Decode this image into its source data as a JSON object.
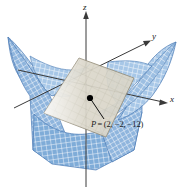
{
  "figure": {
    "kind": "3d-surface-with-tangent-plane",
    "background_color": "#ffffff",
    "surface": {
      "name": "saddle-surface",
      "type": "hyperbolic-paraboloid",
      "mesh_line_color": "#ffffff",
      "edge_color": "#3f6fad",
      "fill_color_light": "#a9c6e6",
      "fill_color_mid": "#86aed9",
      "fill_color_dark": "#6d9bcd"
    },
    "tangent_plane": {
      "name": "tangent-plane",
      "fill_color": "#d6d2c4",
      "edge_color": "#8f8873",
      "grid_color": "#b8b3a3"
    },
    "point": {
      "name": "point-P",
      "marker_color": "#000000",
      "label": "P = (2, −2, −12)",
      "label_parts": {
        "symbol": "P",
        "equals": "=",
        "coordinates": "(2, −2, −12)",
        "x": "2",
        "y": "−2",
        "z": "−12"
      }
    },
    "axes": {
      "color": "#3a3a3a",
      "items": [
        {
          "id": "z",
          "label": "z",
          "direction": "up"
        },
        {
          "id": "y",
          "label": "y",
          "direction": "upper-right"
        },
        {
          "id": "x",
          "label": "x",
          "direction": "right"
        }
      ]
    }
  }
}
